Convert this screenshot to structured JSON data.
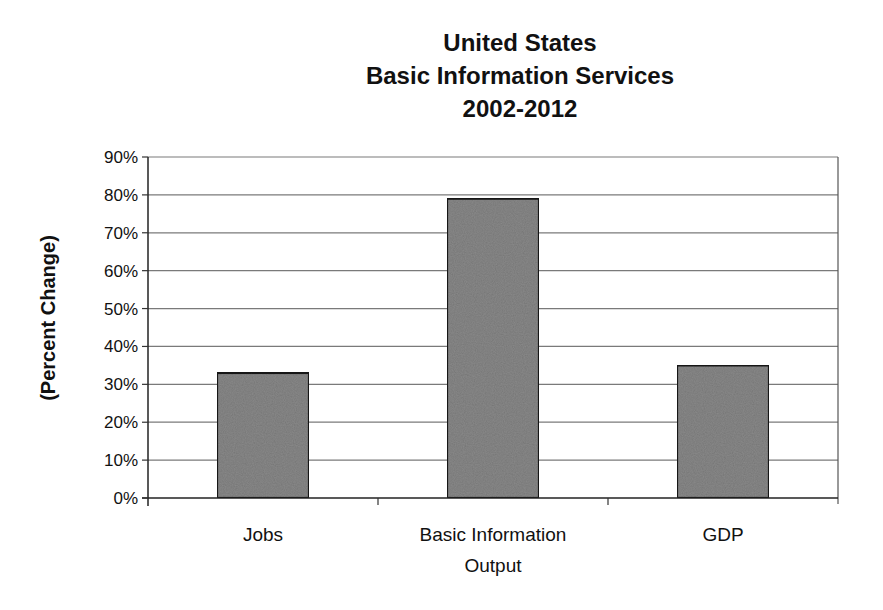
{
  "chart_data": {
    "type": "bar",
    "title": "United States\nBasic Information Services\n2002-2012",
    "title_lines": [
      "United States",
      "Basic Information Services",
      "2002-2012"
    ],
    "xlabel": "",
    "ylabel": "(Percent Change)",
    "categories": [
      "Jobs",
      "Basic Information Output",
      "GDP"
    ],
    "category_label_lines": [
      [
        "Jobs"
      ],
      [
        "Basic Information",
        "Output"
      ],
      [
        "GDP"
      ]
    ],
    "values": [
      33,
      79,
      35
    ],
    "value_unit": "%",
    "ylim": [
      0,
      90
    ],
    "yticks": [
      0,
      10,
      20,
      30,
      40,
      50,
      60,
      70,
      80,
      90
    ],
    "ytick_labels": [
      "0%",
      "10%",
      "20%",
      "30%",
      "40%",
      "50%",
      "60%",
      "70%",
      "80%",
      "90%"
    ],
    "grid": true,
    "legend": "none",
    "bar_color": "#8a8a8a"
  }
}
